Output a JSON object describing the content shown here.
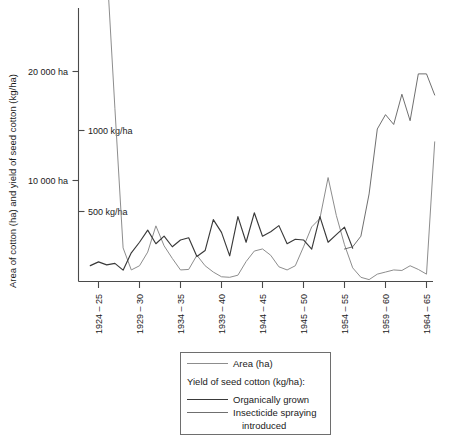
{
  "chart_data": {
    "type": "line",
    "title": "",
    "xlabel": "",
    "ylabel": "Area of cotton (ha) and yield of seed cotton (kg/ha)",
    "grid": false,
    "legend_position": "below-center",
    "y_axis": {
      "left_ticks": [
        {
          "label": "20 000 ha",
          "value": 20000,
          "side": "outer"
        },
        {
          "label": "10 000 ha",
          "value": 10000,
          "side": "outer"
        }
      ],
      "right_ticks": [
        {
          "label": "1000 kg/ha",
          "value": 1000,
          "side": "inner"
        },
        {
          "label": "500 kg/ha",
          "value": 500,
          "side": "inner"
        }
      ],
      "area_range_ha": [
        0,
        28000
      ],
      "yield_range_kg_ha": [
        0,
        1570
      ]
    },
    "x_tick_labels": [
      "1924 – 25",
      "1929 – 30",
      "1934 – 35",
      "1939 – 40",
      "1944 – 45",
      "1945 – 50",
      "1954 – 55",
      "1959 – 60",
      "1964 – 65"
    ],
    "x_tick_values": [
      1924,
      1929,
      1934,
      1939,
      1944,
      1949,
      1954,
      1959,
      1964
    ],
    "x_range": [
      1923,
      1966
    ],
    "series": [
      {
        "name": "Area (ha)",
        "unit": "ha",
        "color": "#8d8d8d",
        "x": [
          1923,
          1924,
          1925,
          1926,
          1927,
          1928,
          1929,
          1930,
          1931,
          1932,
          1933,
          1934,
          1935,
          1936,
          1937,
          1938,
          1939,
          1940,
          1941,
          1942,
          1943,
          1944,
          1945,
          1946,
          1947,
          1948,
          1949,
          1950,
          1951,
          1952,
          1953,
          1954,
          1955,
          1956,
          1957,
          1958,
          1959,
          1960,
          1961,
          1962,
          1963,
          1964,
          1965
        ],
        "values": [
          31500,
          30800,
          30200,
          16500,
          3200,
          1100,
          1500,
          2800,
          5300,
          3400,
          2200,
          1100,
          1150,
          2500,
          1500,
          900,
          450,
          400,
          600,
          1900,
          2900,
          3100,
          2500,
          1400,
          1100,
          1500,
          3300,
          5200,
          6000,
          9900,
          6300,
          3500,
          1300,
          400,
          180,
          700,
          900,
          1100,
          1050,
          1500,
          1150,
          700,
          13300
        ]
      },
      {
        "name": "Organically grown",
        "unit": "kg/ha",
        "color": "#3a3a3a",
        "x": [
          1923,
          1924,
          1925,
          1926,
          1927,
          1928,
          1929,
          1930,
          1931,
          1932,
          1933,
          1934,
          1935,
          1936,
          1937,
          1938,
          1939,
          1940,
          1941,
          1942,
          1943,
          1944,
          1945,
          1946,
          1947,
          1948,
          1949,
          1950,
          1951,
          1952,
          1953,
          1954,
          1955
        ],
        "values": [
          105,
          130,
          110,
          120,
          75,
          190,
          260,
          340,
          250,
          300,
          230,
          275,
          290,
          165,
          205,
          410,
          325,
          170,
          430,
          260,
          455,
          300,
          330,
          370,
          250,
          280,
          275,
          215,
          430,
          260,
          310,
          360,
          220
        ]
      },
      {
        "name": "Insecticide spraying introduced",
        "unit": "kg/ha",
        "color": "#555555",
        "x": [
          1954,
          1955,
          1956,
          1957,
          1958,
          1959,
          1960,
          1961,
          1962,
          1963,
          1964,
          1965
        ],
        "values": [
          215,
          230,
          300,
          580,
          1010,
          1105,
          1040,
          1240,
          1065,
          1375,
          1375,
          1235
        ]
      }
    ]
  },
  "legend": {
    "entries": [
      {
        "label": "Area (ha)",
        "swatch": "area"
      },
      {
        "label": "Yield of seed cotton (kg/ha):",
        "swatch": "none"
      },
      {
        "label": "Organically grown",
        "swatch": "organic"
      },
      {
        "label": "Insecticide spraying",
        "swatch": "insecticide"
      },
      {
        "label": "introduced",
        "swatch": "none"
      }
    ]
  }
}
